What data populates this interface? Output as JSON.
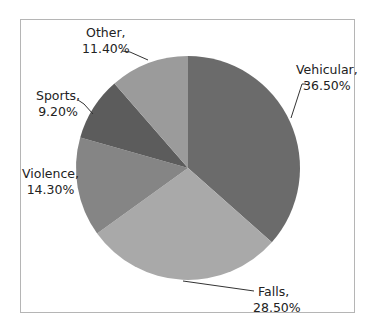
{
  "chart_data": {
    "type": "pie",
    "title": "",
    "categories": [
      "Vehicular",
      "Falls",
      "Violence",
      "Sports",
      "Other"
    ],
    "values": [
      36.5,
      28.5,
      14.3,
      9.2,
      11.4
    ],
    "labels": [
      {
        "name": "Vehicular,",
        "value": "36.50%"
      },
      {
        "name": "Falls,",
        "value": "28.50%"
      },
      {
        "name": "Violence,",
        "value": "14.30%"
      },
      {
        "name": "Sports,",
        "value": "9.20%"
      },
      {
        "name": "Other,",
        "value": "11.40%"
      }
    ],
    "colors": [
      "#6b6b6b",
      "#a9a9a9",
      "#858585",
      "#5c5c5c",
      "#9b9b9b"
    ],
    "start_angle_deg": 0,
    "direction": "clockwise",
    "legend": "none",
    "data_labels": "outside with leader lines"
  }
}
